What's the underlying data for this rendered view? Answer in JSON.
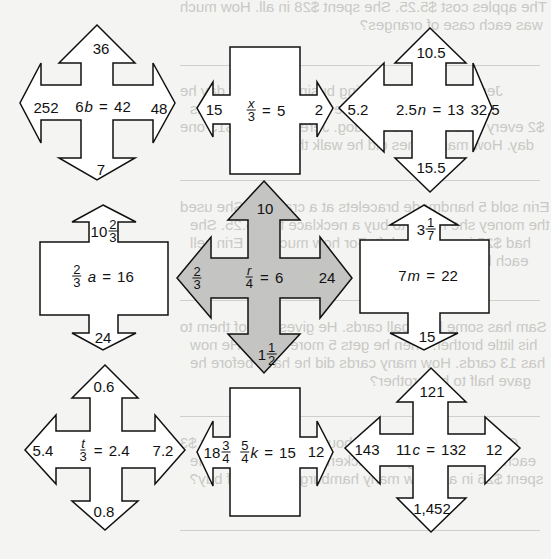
{
  "puzzle": {
    "shapes": [
      {
        "id": "shape-1",
        "type": "four-way-arrow",
        "fill": "#ffffff",
        "equation": {
          "coef": "6",
          "var": "b",
          "rhs": "42"
        },
        "arrows": {
          "up": "36",
          "left": "252",
          "right": "48",
          "down": "7"
        }
      },
      {
        "id": "shape-2",
        "type": "box-left-right",
        "fill": "#ffffff",
        "equation": {
          "frac_num": "x",
          "frac_den": "3",
          "rhs": "5"
        },
        "arrows": {
          "left": "15",
          "right": "2"
        }
      },
      {
        "id": "shape-3",
        "type": "four-way-arrow",
        "fill": "#ffffff",
        "equation": {
          "coef": "2.5",
          "var": "n",
          "rhs": "13"
        },
        "arrows": {
          "up": "10.5",
          "left": "5.2",
          "right": "32.5",
          "down": "15.5"
        }
      },
      {
        "id": "shape-4",
        "type": "box-up-down",
        "fill": "#ffffff",
        "equation": {
          "frac_num": "2",
          "frac_den": "3",
          "var": "a",
          "rhs": "16"
        },
        "arrows": {
          "up_whole": "10",
          "up_num": "2",
          "up_den": "3",
          "down": "24"
        }
      },
      {
        "id": "shape-5",
        "type": "four-way-arrow",
        "fill": "#c4c4c2",
        "equation": {
          "frac_num": "r",
          "frac_den": "4",
          "rhs": "6"
        },
        "arrows": {
          "up": "10",
          "left_num": "2",
          "left_den": "3",
          "right": "24",
          "down_whole": "1",
          "down_num": "1",
          "down_den": "2"
        }
      },
      {
        "id": "shape-6",
        "type": "box-up-down",
        "fill": "#ffffff",
        "equation": {
          "coef": "7",
          "var": "m",
          "rhs": "22"
        },
        "arrows": {
          "up_whole": "3",
          "up_num": "1",
          "up_den": "7",
          "down": "15"
        }
      },
      {
        "id": "shape-7",
        "type": "four-way-arrow",
        "fill": "#ffffff",
        "equation": {
          "frac_num": "t",
          "frac_den": "3",
          "rhs": "2.4"
        },
        "arrows": {
          "up": "0.6",
          "left": "5.4",
          "right": "7.2",
          "down": "0.8"
        }
      },
      {
        "id": "shape-8",
        "type": "box-left-right",
        "fill": "#ffffff",
        "equation": {
          "frac_num": "5",
          "frac_den": "4",
          "var": "k",
          "rhs": "15"
        },
        "arrows": {
          "left_whole": "18",
          "left_num": "3",
          "left_den": "4",
          "right": "12"
        }
      },
      {
        "id": "shape-9",
        "type": "four-way-arrow",
        "fill": "#ffffff",
        "equation": {
          "coef": "11",
          "var": "c",
          "rhs": "132"
        },
        "arrows": {
          "up": "121",
          "left": "143",
          "right": "12",
          "down": "1,452"
        }
      }
    ],
    "equals": "="
  },
  "bleed_through": [
    "The apples cost $5.25. She spent $28 in all. How much",
    "was each case of oranges?",
    "Jeremy has a dog-sitting business. Every day he",
    "walks the dog at the same time and earns",
    "$2 every time he walks the dog. Jeremy made $13 one",
    "day. How many times did he walk the dog?",
    "Erin sold 5 handmade bracelets at a craft fair. She used",
    "the money she made to buy a necklace for $5.25. She",
    "had $25 in earnings left. For how much did Erin sell",
    "each bracelet?",
    "Sam has some baseball cards. He gives half of them to",
    "his little brother. Then he gets 5 more cards. He now",
    "has 13 cards. How many cards did he have before he",
    "gave half to his brother?",
    "One week for lunch, Jeff bought hamburgers for $3",
    "each. He also bought a chicken sandwich for $5. He",
    "spent $26 in all. How many hamburgers did Jeff buy?"
  ],
  "colors": {
    "background": "#f4f4f2",
    "stroke": "#111111",
    "highlight_fill": "#c4c4c2",
    "bleed_text": "#c9c9c6"
  }
}
